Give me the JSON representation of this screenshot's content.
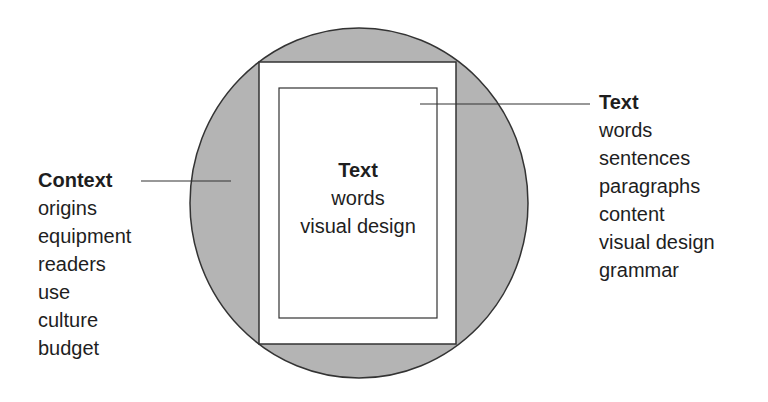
{
  "colors": {
    "circle_fill": "#b4b4b4",
    "stroke": "#333333",
    "page_fill": "#ffffff",
    "text": "#1e1e1e"
  },
  "center": {
    "title": "Text",
    "items": [
      "words",
      "visual design"
    ]
  },
  "left": {
    "title": "Context",
    "items": [
      "origins",
      "equipment",
      "readers",
      "use",
      "culture",
      "budget"
    ]
  },
  "right": {
    "title": "Text",
    "items": [
      "words",
      "sentences",
      "paragraphs",
      "content",
      "visual design",
      "grammar"
    ]
  }
}
